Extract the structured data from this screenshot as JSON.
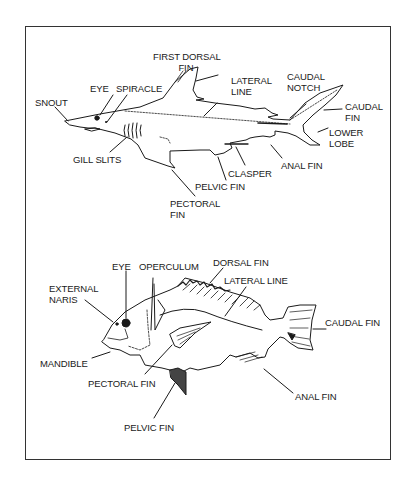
{
  "shark": {
    "title": "Shark external anatomy",
    "labels": {
      "first_dorsal_fin": "FIRST DORSAL\n          FIN",
      "lateral_line": "LATERAL\nLINE",
      "caudal_notch": "CAUDAL\nNOTCH",
      "caudal_fin": "CAUDAL\nFIN",
      "lower_lobe": "LOWER\nLOBE",
      "eye": "EYE",
      "spiracle": "SPIRACLE",
      "snout": "SNOUT",
      "gill_slits": "GILL SLITS",
      "clasper": "CLASPER",
      "anal_fin": "ANAL FIN",
      "pelvic_fin": "PELVIC FIN",
      "pectoral_fin": "PECTORAL\nFIN"
    }
  },
  "bony_fish": {
    "title": "Bony fish external anatomy",
    "labels": {
      "eye": "EYE",
      "operculum": "OPERCULUM",
      "dorsal_fin": "DORSAL FIN",
      "lateral_line": "LATERAL LINE",
      "external_naris": "EXTERNAL\nNARIS",
      "caudal_fin": "CAUDAL FIN",
      "mandible": "MANDIBLE",
      "pectoral_fin": "PECTORAL FIN",
      "anal_fin": "ANAL FIN",
      "pelvic_fin": "PELVIC FIN"
    }
  },
  "colors": {
    "ink": "#1a1a1a",
    "background": "#ffffff",
    "border": "#333333"
  }
}
